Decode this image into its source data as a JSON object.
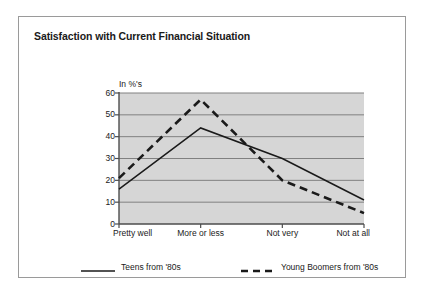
{
  "card": {
    "title": "Satisfaction with Current Financial Situation"
  },
  "chart_data": {
    "type": "line",
    "title": "Satisfaction with Current Financial Situation",
    "xlabel": "",
    "ylabel": "In %'s",
    "axis_unit_label": "In %'s",
    "categories": [
      "Pretty well",
      "More or less",
      "Not very",
      "Not at all"
    ],
    "series": [
      {
        "name": "Teens from '80s",
        "style": "solid",
        "color": "#1a1a1a",
        "values": [
          16,
          44,
          30,
          11
        ]
      },
      {
        "name": "Young Boomers from '80s",
        "style": "dashed",
        "color": "#1a1a1a",
        "values": [
          21,
          57,
          20,
          5
        ]
      }
    ],
    "ylim": [
      0,
      60
    ],
    "yticks": [
      0,
      10,
      20,
      30,
      40,
      50,
      60
    ],
    "ytick_labels": [
      "0",
      "10",
      "20",
      "30",
      "40",
      "50",
      "60"
    ],
    "grid": true,
    "grid_color": "#808080",
    "plot_background": "#d6d6d6",
    "legend_position": "bottom"
  },
  "legend": {
    "entries": [
      {
        "label": "Teens from '80s",
        "style": "solid"
      },
      {
        "label": "Young Boomers from '80s",
        "style": "dashed"
      }
    ]
  }
}
